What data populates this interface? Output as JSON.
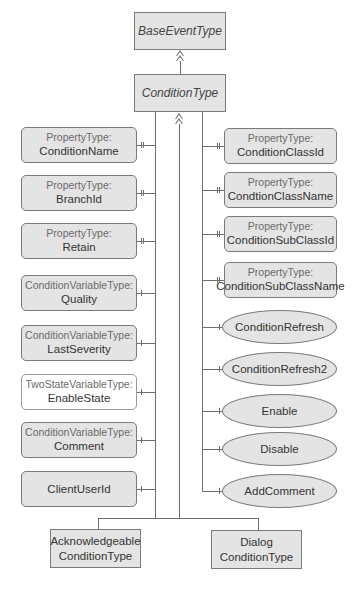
{
  "diagram": {
    "base": {
      "label": "BaseEventType"
    },
    "condition": {
      "label": "ConditionType"
    },
    "left_items": [
      {
        "type": "PropertyType:",
        "name": "ConditionName",
        "filled": true,
        "ref": "property"
      },
      {
        "type": "PropertyType:",
        "name": "BranchId",
        "filled": true,
        "ref": "property"
      },
      {
        "type": "PropertyType:",
        "name": "Retain",
        "filled": true,
        "ref": "property"
      },
      {
        "type": "ConditionVariableType:",
        "name": "Quality",
        "filled": true,
        "ref": "component"
      },
      {
        "type": "ConditionVariableType:",
        "name": "LastSeverity",
        "filled": true,
        "ref": "component"
      },
      {
        "type": "TwoStateVariableType:",
        "name": "EnableState",
        "filled": false,
        "ref": "component"
      },
      {
        "type": "ConditionVariableType:",
        "name": "Comment",
        "filled": true,
        "ref": "component"
      },
      {
        "type": "",
        "name": "ClientUserId",
        "filled": true,
        "ref": "component"
      }
    ],
    "right_properties": [
      {
        "type": "PropertyType:",
        "name": "ConditionClassId"
      },
      {
        "type": "PropertyType:",
        "name": "CondtionClassName"
      },
      {
        "type": "PropertyType:",
        "name": "ConditionSubClassId"
      },
      {
        "type": "PropertyType:",
        "name": "ConditionSubClassName"
      }
    ],
    "right_methods": [
      {
        "name": "ConditionRefresh"
      },
      {
        "name": "ConditionRefresh2"
      },
      {
        "name": "Enable"
      },
      {
        "name": "Disable"
      },
      {
        "name": "AddComment"
      }
    ],
    "subtypes": [
      {
        "line1": "Acknowledgeable",
        "line2": "ConditionType"
      },
      {
        "line1": "Dialog",
        "line2": "ConditionType"
      }
    ],
    "colors": {
      "fill": "#e4e4e4",
      "stroke": "#7a7a7a",
      "line": "#6e6e6e"
    }
  }
}
